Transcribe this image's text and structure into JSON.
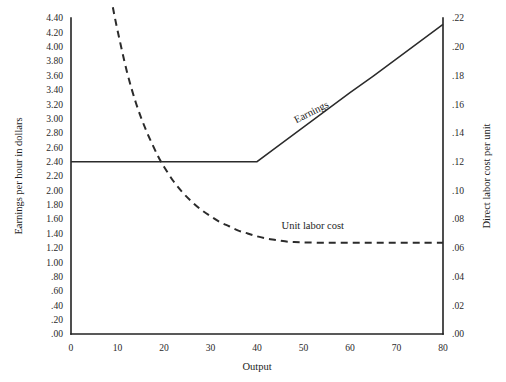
{
  "chart_data": {
    "type": "line",
    "title": "",
    "xlabel": "Output",
    "ylabel": "Earnings per hour in dollars",
    "y2label": "Direct labor cost per unit",
    "grid": false,
    "legend_position": "inline-annotation",
    "xlim": [
      0,
      80
    ],
    "ylim": [
      0.0,
      4.4
    ],
    "y2lim": [
      0.0,
      0.22
    ],
    "xticks": [
      0,
      10,
      20,
      30,
      40,
      50,
      60,
      70,
      80
    ],
    "xtick_labels": [
      "0",
      "10",
      "20",
      "30",
      "40",
      "50",
      "60",
      "70",
      "80"
    ],
    "yticks": [
      0.0,
      0.2,
      0.4,
      0.6,
      0.8,
      1.0,
      1.2,
      1.4,
      1.6,
      1.8,
      2.0,
      2.2,
      2.4,
      2.6,
      2.8,
      3.0,
      3.2,
      3.4,
      3.6,
      3.8,
      4.0,
      4.2,
      4.4
    ],
    "ytick_labels": [
      ".00",
      ".20",
      ".40",
      ".60",
      ".80",
      "1.00",
      "1.20",
      "1.40",
      "1.60",
      "1.80",
      "2.00",
      "2.20",
      "2.40",
      "2.60",
      "2.80",
      "3.00",
      "3.20",
      "3.40",
      "3.60",
      "3.80",
      "4.00",
      "4.20",
      "4.40"
    ],
    "y2ticks": [
      0.0,
      0.02,
      0.04,
      0.06,
      0.08,
      0.1,
      0.12,
      0.14,
      0.16,
      0.18,
      0.2,
      0.22
    ],
    "y2tick_labels": [
      ".00",
      ".02",
      ".04",
      ".06",
      ".08",
      ".10",
      ".12",
      ".14",
      ".16",
      ".18",
      ".20",
      ".22"
    ],
    "series": [
      {
        "name": "Earnings",
        "axis": "left",
        "style": "solid",
        "label_text": "Earnings",
        "label_x": 52,
        "label_y": 3.05,
        "label_rotation": -27,
        "x": [
          0,
          5,
          10,
          15,
          20,
          25,
          30,
          35,
          40,
          45,
          50,
          55,
          60,
          65,
          70,
          75,
          80
        ],
        "values": [
          2.4,
          2.4,
          2.4,
          2.4,
          2.4,
          2.4,
          2.4,
          2.4,
          2.4,
          2.64,
          2.88,
          3.12,
          3.36,
          3.59,
          3.83,
          4.07,
          4.31
        ]
      },
      {
        "name": "Unit labor cost",
        "axis": "right",
        "style": "dashed",
        "label_text": "Unit labor cost",
        "label_x": 52,
        "label_y": 1.46,
        "label_rotation": 0,
        "x": [
          9,
          10,
          12,
          14,
          16,
          18,
          19,
          20,
          22,
          24,
          26,
          28,
          30,
          32,
          34,
          36,
          38,
          40,
          42,
          44,
          46,
          48,
          50,
          55,
          60,
          65,
          70,
          75,
          80
        ],
        "values_left_axis": [
          4.55,
          4.23,
          3.66,
          3.21,
          2.86,
          2.57,
          2.44,
          2.33,
          2.13,
          1.97,
          1.84,
          1.73,
          1.64,
          1.56,
          1.5,
          1.44,
          1.4,
          1.36,
          1.33,
          1.31,
          1.29,
          1.28,
          1.275,
          1.27,
          1.27,
          1.27,
          1.27,
          1.27,
          1.27
        ],
        "values": [
          0.2275,
          0.2115,
          0.183,
          0.1605,
          0.143,
          0.1285,
          0.122,
          0.1165,
          0.1065,
          0.0985,
          0.092,
          0.0865,
          0.082,
          0.078,
          0.075,
          0.072,
          0.07,
          0.068,
          0.0665,
          0.0655,
          0.0645,
          0.064,
          0.0638,
          0.0635,
          0.0635,
          0.0635,
          0.0635,
          0.0635,
          0.0635
        ]
      }
    ],
    "annotations": [
      {
        "text": "Earnings",
        "note": "rotated label sitting on the rising solid segment"
      },
      {
        "text": "Unit labor cost",
        "note": "horizontal label above the flat dashed tail"
      }
    ],
    "colors": {
      "line": "#2b2b2b",
      "axis": "#222222",
      "text": "#1d1d1d",
      "background": "#ffffff"
    }
  }
}
